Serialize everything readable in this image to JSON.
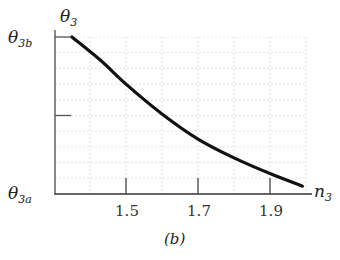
{
  "chart_data": {
    "type": "line",
    "title": "",
    "caption": "(b)",
    "xlabel": "n3",
    "ylabel": "θ3",
    "x_ticks": [
      1.5,
      1.7,
      1.9
    ],
    "x_tick_labels": [
      "1.5",
      "1.7",
      "1.9"
    ],
    "y_tick_labels": [
      "θ3a",
      "",
      "θ3b"
    ],
    "y_tick_positions_normalized": [
      0,
      0.5,
      1
    ],
    "xlim": [
      1.31,
      2.0
    ],
    "ylim_normalized": [
      0,
      1
    ],
    "grid": true,
    "legend": null,
    "series": [
      {
        "name": "θ3 vs n3",
        "x": [
          1.35,
          1.43,
          1.5,
          1.6,
          1.7,
          1.8,
          1.9,
          1.99
        ],
        "y_normalized": [
          1.0,
          0.85,
          0.7,
          0.51,
          0.35,
          0.23,
          0.13,
          0.05
        ]
      }
    ]
  },
  "labels": {
    "y_axis": {
      "symbol": "θ",
      "sub": "3"
    },
    "y_top": {
      "symbol": "θ",
      "sub": "3b"
    },
    "y_bottom": {
      "symbol": "θ",
      "sub": "3a"
    },
    "x_axis": {
      "symbol": "n",
      "sub": "3"
    },
    "caption": "(b)",
    "x_ticks": [
      "1.5",
      "1.7",
      "1.9"
    ]
  }
}
